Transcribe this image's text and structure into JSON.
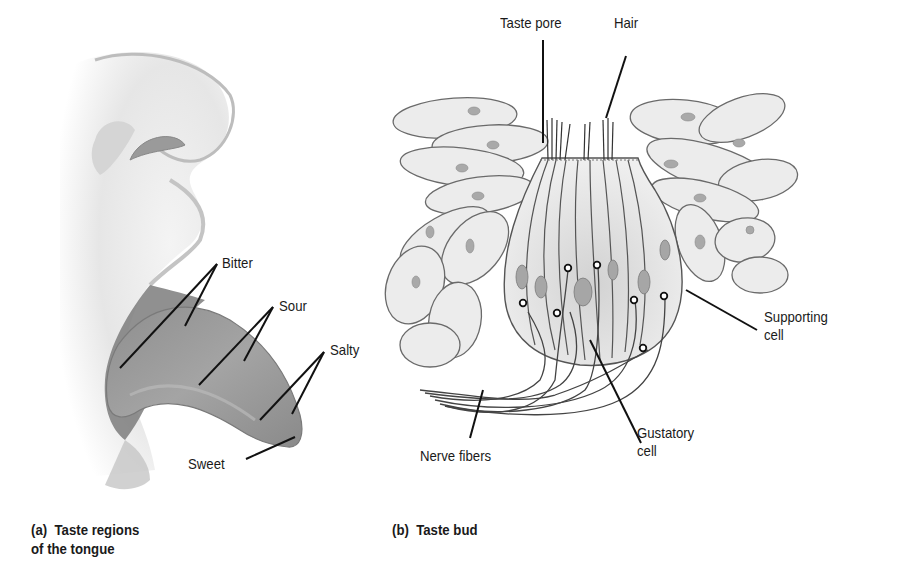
{
  "panel_a": {
    "caption": "(a)  Taste regions\nof the tongue",
    "labels": {
      "bitter": "Bitter",
      "sour": "Sour",
      "salty": "Salty",
      "sweet": "Sweet"
    }
  },
  "panel_b": {
    "caption": "(b)  Taste bud",
    "labels": {
      "taste_pore": "Taste pore",
      "hair": "Hair",
      "supporting_cell": "Supporting\ncell",
      "gustatory_cell": "Gustatory\ncell",
      "nerve_fibers": "Nerve fibers"
    }
  },
  "colors": {
    "background": "#ffffff",
    "ink": "#1a1a1a",
    "skin_shade": "#c8c8c8",
    "tongue": "#9a9a9a",
    "cell_fill": "#ebebeb"
  }
}
